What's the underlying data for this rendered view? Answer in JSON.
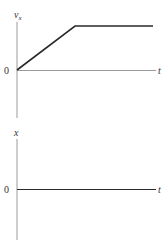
{
  "top_graph": {
    "y_label": "v",
    "y_label_sub": "x",
    "x_label": "t",
    "origin_label": "0",
    "curve": {
      "description": "velocity increases linearly from 0 then stays constant",
      "points": [
        [
          0,
          0
        ],
        [
          0.42,
          1
        ],
        [
          1,
          1
        ]
      ]
    }
  },
  "bottom_graph": {
    "y_label": "x",
    "x_label": "t",
    "origin_label": "0",
    "curve": null
  },
  "colors": {
    "axis": "#9a9a9a",
    "curve": "#2a2a2a",
    "text": "#333333"
  }
}
